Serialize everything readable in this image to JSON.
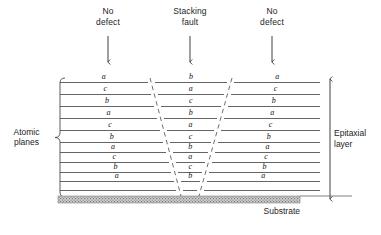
{
  "diagram": {
    "headers": [
      {
        "name": "no-defect-left",
        "line1": "No",
        "line2": "defect",
        "x": 108,
        "arrow_x": 108
      },
      {
        "name": "stacking-fault",
        "line1": "Stacking",
        "line2": "fault",
        "x": 190,
        "arrow_x": 190
      },
      {
        "name": "no-defect-right",
        "line1": "No",
        "line2": "defect",
        "x": 272,
        "arrow_x": 272
      }
    ],
    "atomic_planes_label": {
      "line1": "Atomic",
      "line2": "planes"
    },
    "epitaxial_label": {
      "line1": "Epitaxial",
      "line2": "layer"
    },
    "substrate_label": "Substrate",
    "colors": {
      "line": "#4a4a4a",
      "text": "#1d1d1d",
      "substrate_fill": "#b4b4b4",
      "dashed": "#555555"
    },
    "row_y": [
      82,
      94,
      106,
      118,
      130,
      142,
      152,
      162,
      172,
      181,
      190
    ],
    "columns": {
      "left": {
        "name": "no-defect-left-column",
        "letters": [
          "a",
          "c",
          "b",
          "a",
          "c",
          "b",
          "a",
          "c",
          "b",
          "a"
        ],
        "label_x": 108
      },
      "middle": {
        "name": "stacking-fault-column",
        "letters": [
          "b",
          "a",
          "c",
          "b",
          "a",
          "c",
          "b",
          "a",
          "c",
          "b"
        ],
        "label_x": 190
      },
      "right": {
        "name": "no-defect-right-column",
        "letters": [
          "a",
          "c",
          "b",
          "a",
          "c",
          "b",
          "a",
          "c",
          "b",
          "a"
        ],
        "label_x": 272
      }
    },
    "fault_boundary": {
      "left_top_x": 150,
      "left_bottom_x": 181,
      "right_top_x": 232,
      "right_bottom_x": 199,
      "top_y": 78,
      "bottom_y": 196
    },
    "geometry": {
      "plot_left": 60,
      "plot_right": 320,
      "substrate_top": 196,
      "substrate_bottom": 203,
      "substrate_left": 58,
      "substrate_right": 300,
      "brace_x": 60,
      "arrow_x": 330,
      "arrow_top": 78,
      "arrow_bottom": 200
    }
  }
}
